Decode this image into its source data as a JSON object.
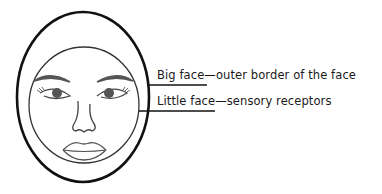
{
  "diagram": {
    "labels": [
      {
        "id": "big-face",
        "text": "Big face—outer border of the face"
      },
      {
        "id": "little-face",
        "text": "Little face—sensory receptors"
      }
    ]
  },
  "colors": {
    "outline": "#111111",
    "inner_outline": "#333333",
    "feature": "#444444",
    "background": "#ffffff"
  }
}
